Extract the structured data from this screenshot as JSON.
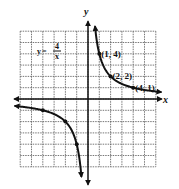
{
  "graph": {
    "function_label": {
      "y": "y",
      "eq": "=",
      "num": "4",
      "den": "x"
    },
    "x_axis_label": "x",
    "y_axis_label": "y",
    "x_range": [
      -6,
      6
    ],
    "y_range": [
      -6,
      6
    ],
    "grid": true,
    "points": [
      {
        "x": 1,
        "y": 4,
        "label": "(1, 4)"
      },
      {
        "x": 2,
        "y": 2,
        "label": "(2, 2)"
      },
      {
        "x": 4,
        "y": 1,
        "label": "(4, 1)"
      },
      {
        "x": -4,
        "y": -1,
        "label": ""
      },
      {
        "x": -2,
        "y": -2,
        "label": ""
      },
      {
        "x": -1,
        "y": -4,
        "label": ""
      }
    ],
    "colors": {
      "ink": "#111111",
      "grid": "#555555"
    }
  }
}
